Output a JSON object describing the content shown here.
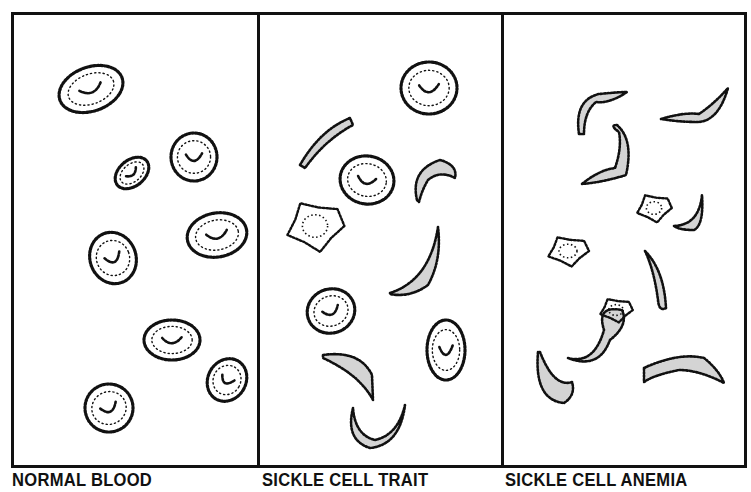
{
  "figure": {
    "colors": {
      "ink": "#111111",
      "background": "#ffffff"
    },
    "panels": [
      {
        "id": "normal",
        "caption": "NORMAL BLOOD",
        "cells": [
          {
            "type": "disc",
            "cx": 63,
            "cy": 59,
            "rx": 33,
            "ry": 22,
            "rot": -20
          },
          {
            "type": "disc",
            "cx": 104,
            "cy": 143,
            "rx": 19,
            "ry": 13,
            "rot": -40
          },
          {
            "type": "disc",
            "cx": 166,
            "cy": 127,
            "rx": 23,
            "ry": 24,
            "rot": 0
          },
          {
            "type": "disc",
            "cx": 189,
            "cy": 205,
            "rx": 30,
            "ry": 22,
            "rot": -10
          },
          {
            "type": "disc",
            "cx": 85,
            "cy": 228,
            "rx": 23,
            "ry": 26,
            "rot": -20
          },
          {
            "type": "disc",
            "cx": 144,
            "cy": 310,
            "rx": 28,
            "ry": 20,
            "rot": 0
          },
          {
            "type": "disc",
            "cx": 199,
            "cy": 350,
            "rx": 19,
            "ry": 22,
            "rot": 30
          },
          {
            "type": "disc",
            "cx": 81,
            "cy": 378,
            "rx": 24,
            "ry": 24,
            "rot": -20
          }
        ]
      },
      {
        "id": "trait",
        "caption": "SICKLE CELL TRAIT",
        "cells": [
          {
            "type": "disc",
            "cx": 169,
            "cy": 58,
            "rx": 28,
            "ry": 26,
            "rot": 0
          },
          {
            "type": "sickle",
            "path": "M40,135 Q60,100 90,88 L93,95 Q65,110 45,138 Z"
          },
          {
            "type": "disc",
            "cx": 107,
            "cy": 150,
            "rx": 27,
            "ry": 24,
            "rot": 10
          },
          {
            "type": "sickle",
            "path": "M157,170 Q150,140 180,130 Q198,135 195,148 Q180,140 168,150 Q162,160 159,172 Z"
          },
          {
            "type": "blob",
            "cx": 55,
            "cy": 196,
            "rx": 28,
            "ry": 25
          },
          {
            "type": "sickle",
            "path": "M130,263 Q170,250 178,197 Q182,230 168,255 Q150,268 130,264 Z"
          },
          {
            "type": "disc",
            "cx": 71,
            "cy": 281,
            "rx": 24,
            "ry": 22,
            "rot": -20
          },
          {
            "type": "disc",
            "cx": 186,
            "cy": 320,
            "rx": 19,
            "ry": 30,
            "rot": 0
          },
          {
            "type": "sickle",
            "path": "M63,325 Q100,320 112,345 L113,370 Q100,345 63,328 Z"
          },
          {
            "type": "sickle",
            "path": "M93,378 Q85,410 110,418 Q140,415 145,375 Q138,405 115,410 Q95,405 93,378 Z"
          }
        ]
      },
      {
        "id": "anemia",
        "caption": "SICKLE CELL ANEMIA",
        "cells": [
          {
            "type": "sickle",
            "path": "M75,104 Q70,70 95,64 Q115,62 123,62 Q105,74 92,72 Q80,82 80,104 Z"
          },
          {
            "type": "sickle",
            "path": "M157,89 Q180,82 195,84 Q210,74 224,58 Q215,90 195,92 Q175,92 157,89 Z"
          },
          {
            "type": "sickle",
            "path": "M78,154 Q95,140 111,138 Q118,118 115,102 Q105,95 113,95 Q130,110 122,145 Q100,152 78,154 Z"
          },
          {
            "type": "blob",
            "cx": 150,
            "cy": 178,
            "rx": 17,
            "ry": 14
          },
          {
            "type": "sickle",
            "path": "M170,196 Q195,195 198,165 Q200,195 190,200 Q175,200 170,196 Z"
          },
          {
            "type": "blob",
            "cx": 64,
            "cy": 221,
            "rx": 20,
            "ry": 15
          },
          {
            "type": "sickle",
            "path": "M141,221 Q160,240 162,278 Q155,282 154,270 Q150,240 141,221 Z"
          },
          {
            "type": "sickle",
            "path": "M64,328 Q90,335 100,300 Q92,275 118,280 Q125,295 106,310 Q95,340 64,328 Z"
          },
          {
            "type": "blob",
            "cx": 112,
            "cy": 280,
            "rx": 16,
            "ry": 12
          },
          {
            "type": "sickle",
            "path": "M34,322 Q30,370 60,373 Q72,365 68,352 Q50,358 36,322 Z"
          },
          {
            "type": "sickle",
            "path": "M140,338 Q175,322 200,328 Q215,340 220,353 Q195,340 175,340 Q150,345 140,352 Z"
          }
        ]
      }
    ]
  }
}
